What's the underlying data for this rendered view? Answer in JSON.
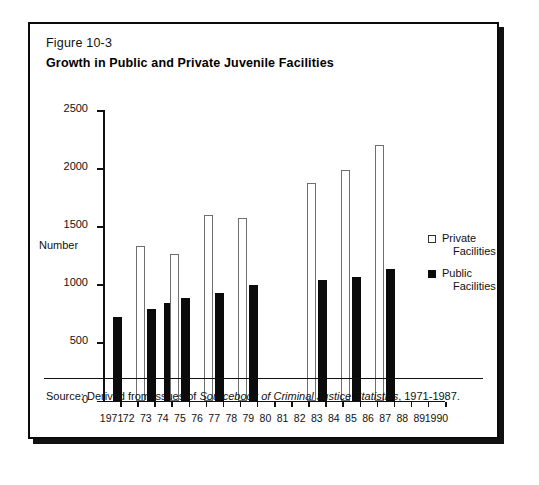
{
  "figure": {
    "number": "Figure 10-3",
    "title": "Growth in Public and Private Juvenile Facilities",
    "source_note_prefix": "Source: Derived from issues of ",
    "source_note_italic": "Sourcebook of Criminal Justice Statistics",
    "source_note_suffix": ", 1971-1987."
  },
  "legend": {
    "position": "right-middle",
    "entries": [
      {
        "swatch": "open-square-swatch",
        "line1": "Private",
        "line2": "Facilities"
      },
      {
        "swatch": "filled-square-swatch",
        "line1": "Public",
        "line2": "Facilities"
      }
    ]
  },
  "chart_data": {
    "type": "bar",
    "title": "Growth in Public and Private Juvenile Facilities",
    "xlabel": "",
    "ylabel": "Number",
    "ylim": [
      0,
      2500
    ],
    "yticks": [
      0,
      500,
      1000,
      1500,
      2000,
      2500
    ],
    "grid": false,
    "categories": [
      "1971",
      "72",
      "73",
      "74",
      "75",
      "76",
      "77",
      "78",
      "79",
      "80",
      "81",
      "82",
      "83",
      "84",
      "85",
      "86",
      "87",
      "88",
      "89",
      "1990"
    ],
    "series": [
      {
        "name": "Private Facilities",
        "color": "#ffffff",
        "edge_color": "#6f6f6f",
        "values": [
          null,
          null,
          1330,
          null,
          1260,
          null,
          1600,
          null,
          1575,
          null,
          null,
          null,
          1870,
          null,
          1985,
          null,
          2200,
          null,
          null,
          null
        ]
      },
      {
        "name": "Public Facilities",
        "color": "#0b0b0b",
        "values": [
          720,
          null,
          790,
          840,
          880,
          null,
          925,
          null,
          995,
          null,
          null,
          null,
          1035,
          null,
          1060,
          null,
          1130,
          null,
          null,
          null
        ]
      }
    ]
  }
}
